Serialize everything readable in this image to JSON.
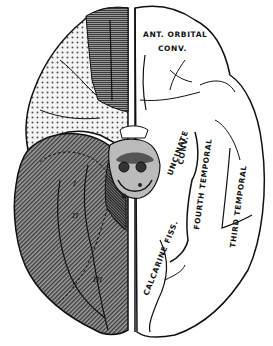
{
  "figure": {
    "view": "inferior surface of brain",
    "labels": {
      "ant_orbital_line1": "ANT. ORBITAL",
      "ant_orbital_line2": "CONV.",
      "uncinate_line1": "UNCINATE",
      "uncinate_line2": "CONV.",
      "fourth_temporal": "FOURTH TEMPORAL",
      "third_temporal": "THIRD TEMPORAL",
      "calcarine": "CALCARINE FISS.",
      "region_1": "I",
      "region_2": "II",
      "region_3": "III"
    },
    "colors": {
      "outline": "#111111",
      "dark_fill": "#6a6a6a",
      "medium_fill": "#7c7c7c",
      "dotted_bg": "#f4f4f4",
      "dot": "#555555",
      "background": "#ffffff"
    }
  }
}
